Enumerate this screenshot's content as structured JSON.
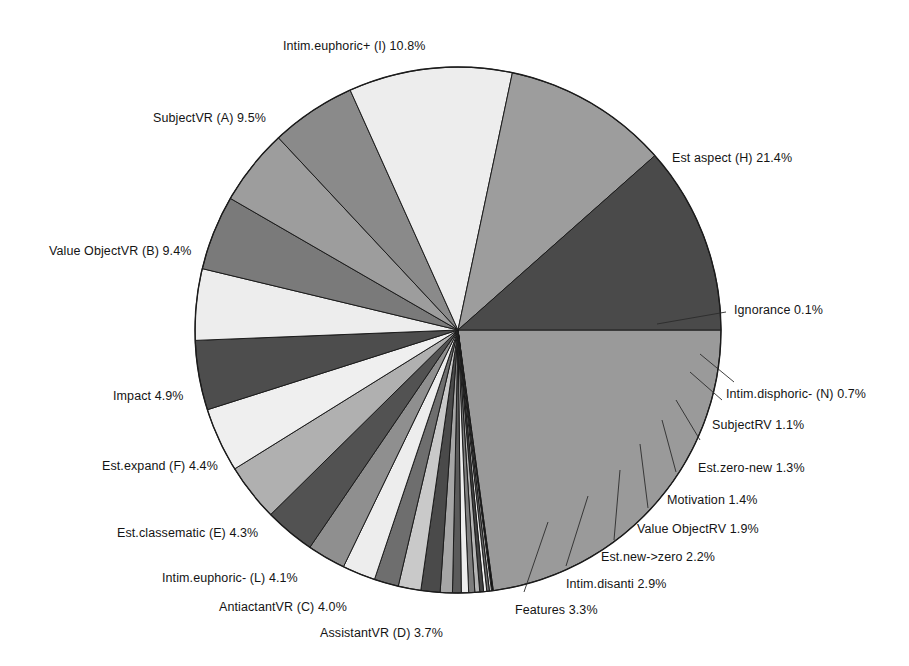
{
  "chart_data": {
    "type": "pie",
    "title": "",
    "subtitle": "",
    "xlabel": "",
    "ylabel": "",
    "legend_position": "none",
    "grid": false,
    "start_angle_deg": 0,
    "direction": "clockwise",
    "value_unit": "%",
    "categories": [
      "Est aspect (H)",
      "Ignorance",
      "Intim.disphoric- (N)",
      "SubjectRV",
      "Est.zero-new",
      "Motivation",
      "Value ObjectRV",
      "Est.new->zero",
      "Intim.disanti",
      "Features",
      "AssistantVR (D)",
      "AntiactantVR (C)",
      "Intim.euphoric- (L)",
      "Est.classematic (E)",
      "Est.expand (F)",
      "Impact",
      "Value ObjectVR (B)",
      "SubjectVR (A)",
      "Intim.euphoric+ (I)"
    ],
    "values": [
      21.4,
      0.1,
      0.7,
      1.1,
      1.3,
      1.4,
      1.9,
      2.2,
      2.9,
      3.3,
      3.7,
      4.0,
      4.1,
      4.3,
      4.4,
      4.9,
      9.4,
      9.5,
      10.8
    ],
    "slices": [
      {
        "label": "Est aspect (H)",
        "value": 21.4,
        "value_text": "21.4%",
        "color": "#9a9a9a"
      },
      {
        "label": "Ignorance",
        "value": 0.1,
        "value_text": "0.1%",
        "color": "#101010"
      },
      {
        "label": "hidden-1",
        "value": 0.12,
        "value_text": "",
        "color": "#d8d8d8"
      },
      {
        "label": "hidden-2",
        "value": 0.15,
        "value_text": "",
        "color": "#6d6d6d"
      },
      {
        "label": "hidden-3",
        "value": 0.18,
        "value_text": "",
        "color": "#f0f0f0"
      },
      {
        "label": "hidden-4",
        "value": 0.22,
        "value_text": "",
        "color": "#454545"
      },
      {
        "label": "hidden-5",
        "value": 0.28,
        "value_text": "",
        "color": "#b5b5b5"
      },
      {
        "label": "hidden-6",
        "value": 0.35,
        "value_text": "",
        "color": "#7d7d7d"
      },
      {
        "label": "hidden-7",
        "value": 0.42,
        "value_text": "",
        "color": "#ededed"
      },
      {
        "label": "hidden-8",
        "value": 0.5,
        "value_text": "",
        "color": "#5a5a5a"
      },
      {
        "label": "Intim.disphoric- (N)",
        "value": 0.7,
        "value_text": "0.7%",
        "color": "#a6a6a6"
      },
      {
        "label": "SubjectRV",
        "value": 1.1,
        "value_text": "1.1%",
        "color": "#4a4a4a"
      },
      {
        "label": "Est.zero-new",
        "value": 1.3,
        "value_text": "1.3%",
        "color": "#c9c9c9"
      },
      {
        "label": "Motivation",
        "value": 1.4,
        "value_text": "1.4%",
        "color": "#6e6e6e"
      },
      {
        "label": "Value ObjectRV",
        "value": 1.9,
        "value_text": "1.9%",
        "color": "#ededed"
      },
      {
        "label": "Est.new->zero",
        "value": 2.2,
        "value_text": "2.2%",
        "color": "#8f8f8f"
      },
      {
        "label": "Intim.disanti",
        "value": 2.9,
        "value_text": "2.9%",
        "color": "#525252"
      },
      {
        "label": "Features",
        "value": 3.3,
        "value_text": "3.3%",
        "color": "#b0b0b0"
      },
      {
        "label": "AssistantVR (D)",
        "value": 3.7,
        "value_text": "3.7%",
        "color": "#efefef"
      },
      {
        "label": "AntiactantVR (C)",
        "value": 4.0,
        "value_text": "4.0%",
        "color": "#4d4d4d"
      },
      {
        "label": "Intim.euphoric- (L)",
        "value": 4.1,
        "value_text": "4.1%",
        "color": "#ededed"
      },
      {
        "label": "Est.classematic (E)",
        "value": 4.3,
        "value_text": "4.3%",
        "color": "#7a7a7a"
      },
      {
        "label": "Est.expand (F)",
        "value": 4.4,
        "value_text": "4.4%",
        "color": "#9d9d9d"
      },
      {
        "label": "Impact",
        "value": 4.9,
        "value_text": "4.9%",
        "color": "#8a8a8a"
      },
      {
        "label": "Value ObjectVR (B)",
        "value": 9.4,
        "value_text": "9.4%",
        "color": "#ededed"
      },
      {
        "label": "SubjectVR (A)",
        "value": 9.5,
        "value_text": "9.5%",
        "color": "#9d9d9d"
      },
      {
        "label": "Intim.euphoric+ (I)",
        "value": 10.8,
        "value_text": "10.8%",
        "color": "#4a4a4a"
      }
    ]
  },
  "labels": [
    {
      "id": "label-intim-euphoric-plus",
      "name": "Intim.euphoric+ (I)",
      "text": "Intim.euphoric+ (I)  10.8%",
      "x": 283,
      "y": 40
    },
    {
      "id": "label-subjectvr-a",
      "name": "SubjectVR (A)",
      "text": "SubjectVR (A)  9.5%",
      "x": 153,
      "y": 112
    },
    {
      "id": "label-value-objectvr-b",
      "name": "Value ObjectVR (B)",
      "text": "Value ObjectVR (B)  9.4%",
      "x": 49,
      "y": 245
    },
    {
      "id": "label-impact",
      "name": "Impact",
      "text": "Impact  4.9%",
      "x": 113,
      "y": 390
    },
    {
      "id": "label-est-expand-f",
      "name": "Est.expand (F)",
      "text": "Est.expand (F)  4.4%",
      "x": 102,
      "y": 460
    },
    {
      "id": "label-est-classematic-e",
      "name": "Est.classematic (E)",
      "text": "Est.classematic (E)  4.3%",
      "x": 117,
      "y": 527
    },
    {
      "id": "label-intim-euphoric-minus-l",
      "name": "Intim.euphoric- (L)",
      "text": "Intim.euphoric- (L)  4.1%",
      "x": 162,
      "y": 572
    },
    {
      "id": "label-antiactantvr-c",
      "name": "AntiactantVR (C)",
      "text": "AntiactantVR (C)  4.0%",
      "x": 219,
      "y": 601
    },
    {
      "id": "label-assistantvr-d",
      "name": "AssistantVR (D)",
      "text": "AssistantVR (D)  3.7%",
      "x": 320,
      "y": 627
    },
    {
      "id": "label-features",
      "name": "Features",
      "text": "Features  3.3%",
      "x": 515,
      "y": 604
    },
    {
      "id": "label-intim-disanti",
      "name": "Intim.disanti",
      "text": "Intim.disanti  2.9%",
      "x": 566,
      "y": 578
    },
    {
      "id": "label-est-new-zero",
      "name": "Est.new->zero",
      "text": "Est.new->zero  2.2%",
      "x": 601,
      "y": 551
    },
    {
      "id": "label-value-objectrv",
      "name": "Value ObjectRV",
      "text": "Value ObjectRV  1.9%",
      "x": 637,
      "y": 523
    },
    {
      "id": "label-motivation",
      "name": "Motivation",
      "text": "Motivation  1.4%",
      "x": 667,
      "y": 494
    },
    {
      "id": "label-est-zero-new",
      "name": "Est.zero-new",
      "text": "Est.zero-new  1.3%",
      "x": 698,
      "y": 462
    },
    {
      "id": "label-subjectrv",
      "name": "SubjectRV",
      "text": "SubjectRV  1.1%",
      "x": 712,
      "y": 419
    },
    {
      "id": "label-intim-disphoric-n",
      "name": "Intim.disphoric- (N)",
      "text": "Intim.disphoric- (N)  0.7%",
      "x": 726,
      "y": 388
    },
    {
      "id": "label-ignorance",
      "name": "Ignorance",
      "text": "Ignorance  0.1%",
      "x": 734,
      "y": 304
    },
    {
      "id": "label-est-aspect-h",
      "name": "Est aspect (H)",
      "text": "Est aspect (H)  21.4%",
      "x": 672,
      "y": 152
    }
  ],
  "geometry": {
    "center_x": 458,
    "center_y": 330,
    "radius": 263
  },
  "colors": {
    "background": "#ffffff",
    "outline": "#1c1c1c",
    "text": "#141414"
  }
}
